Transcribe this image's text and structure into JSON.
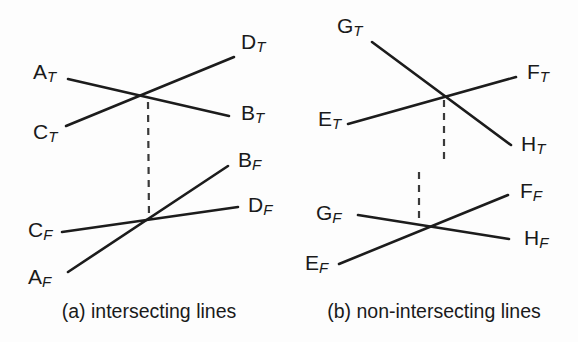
{
  "figure": {
    "width": 578,
    "height": 342,
    "background": "#fdfdfd",
    "line_color": "#1c1c1c",
    "dash_color": "#3a3a3a",
    "text_color": "#1a1a1a"
  },
  "panels": [
    {
      "id": "panel-a",
      "caption": "(a) intersecting lines",
      "caption_x": 149,
      "caption_y": 313,
      "top_view": {
        "id": "top-view-a",
        "intersection": {
          "x": 148,
          "y": 99
        },
        "segments": [
          {
            "id": "seg-a-top-AB",
            "from_label": "A_T",
            "to_label": "B_T",
            "x1": 68,
            "y1": 79,
            "x2": 229,
            "y2": 116
          },
          {
            "id": "seg-a-top-CD",
            "from_label": "C_T",
            "to_label": "D_T",
            "x1": 66,
            "y1": 126,
            "x2": 234,
            "y2": 57
          }
        ],
        "labels": [
          {
            "id": "label-AT",
            "base": "A",
            "sub": "T",
            "x": 33,
            "y": 73
          },
          {
            "id": "label-CT",
            "base": "C",
            "sub": "T",
            "x": 33,
            "y": 133
          },
          {
            "id": "label-DT",
            "base": "D",
            "sub": "T",
            "x": 241,
            "y": 43
          },
          {
            "id": "label-BT",
            "base": "B",
            "sub": "T",
            "x": 241,
            "y": 114
          }
        ]
      },
      "front_view": {
        "id": "front-view-a",
        "intersection": {
          "x": 149,
          "y": 221
        },
        "segments": [
          {
            "id": "seg-a-front-AB",
            "from_label": "A_F",
            "to_label": "B_F",
            "x1": 68,
            "y1": 272,
            "x2": 228,
            "y2": 166
          },
          {
            "id": "seg-a-front-CD",
            "from_label": "C_F",
            "to_label": "D_F",
            "x1": 62,
            "y1": 232,
            "x2": 238,
            "y2": 207
          }
        ],
        "labels": [
          {
            "id": "label-CF",
            "base": "C",
            "sub": "F",
            "x": 28,
            "y": 231
          },
          {
            "id": "label-AF",
            "base": "A",
            "sub": "F",
            "x": 28,
            "y": 278
          },
          {
            "id": "label-BF",
            "base": "B",
            "sub": "F",
            "x": 238,
            "y": 161
          },
          {
            "id": "label-DF",
            "base": "D",
            "sub": "F",
            "x": 248,
            "y": 206
          }
        ]
      },
      "projectors": [
        {
          "id": "proj-a",
          "x1": 148,
          "y1": 102,
          "x2": 149,
          "y2": 218,
          "aligned": true
        }
      ]
    },
    {
      "id": "panel-b",
      "caption": "(b) non-intersecting lines",
      "caption_x": 434,
      "caption_y": 313,
      "top_view": {
        "id": "top-view-b",
        "intersection": {
          "x": 445,
          "y": 97
        },
        "segments": [
          {
            "id": "seg-b-top-EF",
            "from_label": "E_T",
            "to_label": "F_T",
            "x1": 348,
            "y1": 124,
            "x2": 516,
            "y2": 77
          },
          {
            "id": "seg-b-top-GH",
            "from_label": "G_T",
            "to_label": "H_T",
            "x1": 372,
            "y1": 42,
            "x2": 511,
            "y2": 145
          }
        ],
        "labels": [
          {
            "id": "label-GT",
            "base": "G",
            "sub": "T",
            "x": 337,
            "y": 27
          },
          {
            "id": "label-ET",
            "base": "E",
            "sub": "T",
            "x": 318,
            "y": 120
          },
          {
            "id": "label-FT",
            "base": "F",
            "sub": "T",
            "x": 527,
            "y": 73
          },
          {
            "id": "label-HT",
            "base": "H",
            "sub": "T",
            "x": 521,
            "y": 145
          }
        ]
      },
      "front_view": {
        "id": "front-view-b",
        "intersection": {
          "x": 420,
          "y": 224
        },
        "segments": [
          {
            "id": "seg-b-front-EF",
            "from_label": "E_F",
            "to_label": "F_F",
            "x1": 339,
            "y1": 264,
            "x2": 508,
            "y2": 195
          },
          {
            "id": "seg-b-front-GH",
            "from_label": "G_F",
            "to_label": "H_F",
            "x1": 358,
            "y1": 215,
            "x2": 509,
            "y2": 239
          }
        ],
        "labels": [
          {
            "id": "label-GF",
            "base": "G",
            "sub": "F",
            "x": 316,
            "y": 214
          },
          {
            "id": "label-EF",
            "base": "E",
            "sub": "F",
            "x": 305,
            "y": 264
          },
          {
            "id": "label-FF",
            "base": "F",
            "sub": "F",
            "x": 520,
            "y": 192
          },
          {
            "id": "label-HF",
            "base": "H",
            "sub": "F",
            "x": 524,
            "y": 239
          }
        ]
      },
      "projectors": [
        {
          "id": "proj-b-top",
          "x1": 444,
          "y1": 100,
          "x2": 444,
          "y2": 160,
          "aligned": false
        },
        {
          "id": "proj-b-front",
          "x1": 419,
          "y1": 172,
          "x2": 419,
          "y2": 221,
          "aligned": false
        }
      ]
    }
  ]
}
